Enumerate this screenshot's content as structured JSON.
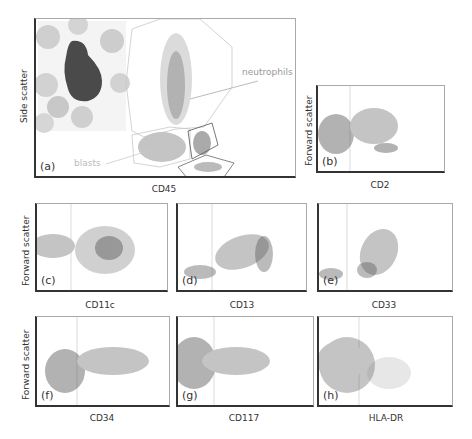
{
  "figure": {
    "panels": [
      {
        "id": "a",
        "label": "(a)",
        "xlabel": "CD45",
        "ylabel": "Side scatter"
      },
      {
        "id": "b",
        "label": "(b)",
        "xlabel": "CD2",
        "ylabel": "Forward scatter"
      },
      {
        "id": "c",
        "label": "(c)",
        "xlabel": "CD11c",
        "ylabel": "Forward scatter"
      },
      {
        "id": "d",
        "label": "(d)",
        "xlabel": "CD13",
        "ylabel": ""
      },
      {
        "id": "e",
        "label": "(e)",
        "xlabel": "CD33",
        "ylabel": ""
      },
      {
        "id": "f",
        "label": "(f)",
        "xlabel": "CD34",
        "ylabel": "Forward scatter"
      },
      {
        "id": "g",
        "label": "(g)",
        "xlabel": "CD117",
        "ylabel": ""
      },
      {
        "id": "h",
        "label": "(h)",
        "xlabel": "HLA-DR",
        "ylabel": ""
      }
    ],
    "annotations": {
      "neutrophils": "neutrophils",
      "blasts": "blasts"
    },
    "colors": {
      "blast_population": "#c4c4c4",
      "other_events": "#555555",
      "gate_outline": "#999999",
      "axis": "#333333"
    }
  }
}
